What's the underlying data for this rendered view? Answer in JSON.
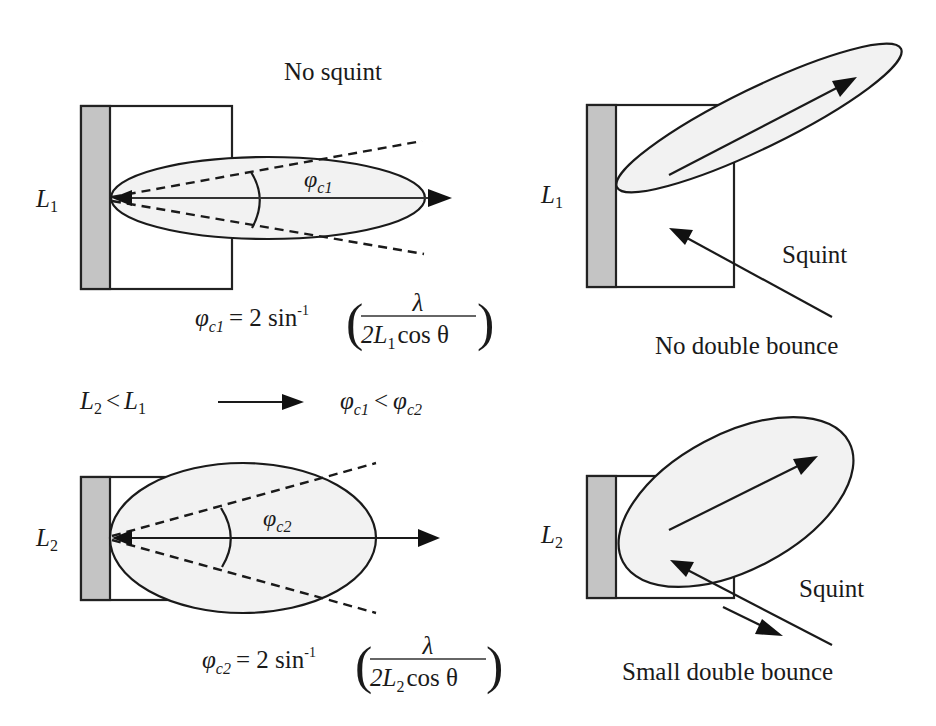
{
  "title": "No squint",
  "colors": {
    "plate": "#c4c4c4",
    "lobe_fill": "#f2f2f2",
    "stroke": "#1a1a1a",
    "background": "#ffffff"
  },
  "panels": {
    "top_left": {
      "length_label": {
        "main": "L",
        "sub": "1"
      },
      "angle_label": {
        "main": "φ",
        "sub": "c1"
      },
      "formula": {
        "lhs_main": "φ",
        "lhs_sub": "c1",
        "eq": "= 2 sin",
        "sup": "-1",
        "numerator": "λ",
        "den_prefix": "2L",
        "den_sub": "1",
        "den_suffix": "cos θ",
        "open_paren": "(",
        "close_paren": ")"
      }
    },
    "top_right": {
      "length_label": {
        "main": "L",
        "sub": "1"
      },
      "squint_label": "Squint",
      "bounce_label": "No double bounce"
    },
    "bottom_left": {
      "length_label": {
        "main": "L",
        "sub": "2"
      },
      "angle_label": {
        "main": "φ",
        "sub": "c2"
      },
      "formula": {
        "lhs_main": "φ",
        "lhs_sub": "c2",
        "eq": "= 2 sin",
        "sup": "-1",
        "numerator": "λ",
        "den_prefix": "2L",
        "den_sub": "2",
        "den_suffix": "cos θ",
        "open_paren": "(",
        "close_paren": ")"
      }
    },
    "bottom_right": {
      "length_label": {
        "main": "L",
        "sub": "2"
      },
      "squint_label": "Squint",
      "bounce_label": "Small double bounce"
    }
  },
  "relation": {
    "left": {
      "a_main": "L",
      "a_sub": "2",
      "op": "<",
      "b_main": "L",
      "b_sub": "1"
    },
    "right": {
      "a_main": "φ",
      "a_sub": "c1",
      "op": "<",
      "b_main": "φ",
      "b_sub": "c2"
    }
  }
}
